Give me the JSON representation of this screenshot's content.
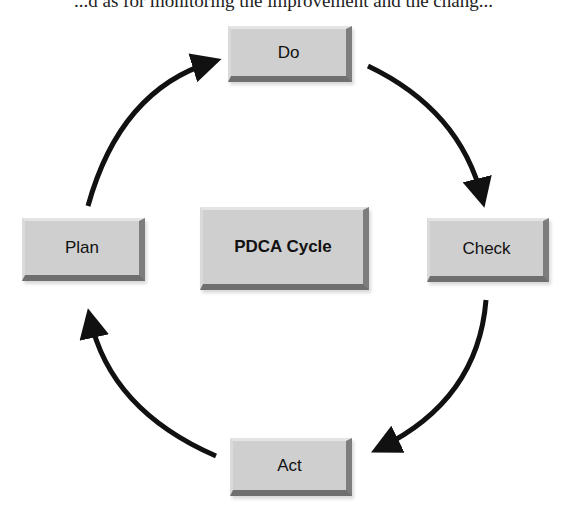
{
  "clipped_text": "...d as for monitoring the improvement and the chang...",
  "diagram": {
    "title": "PDCA Cycle",
    "nodes": [
      {
        "id": "do",
        "label": "Do"
      },
      {
        "id": "check",
        "label": "Check"
      },
      {
        "id": "act",
        "label": "Act"
      },
      {
        "id": "plan",
        "label": "Plan"
      }
    ],
    "edges": [
      {
        "from": "Plan",
        "to": "Do"
      },
      {
        "from": "Do",
        "to": "Check"
      },
      {
        "from": "Check",
        "to": "Act"
      },
      {
        "from": "Act",
        "to": "Plan"
      }
    ],
    "colors": {
      "box": "#cfcfcf",
      "arrow": "#111111"
    }
  }
}
